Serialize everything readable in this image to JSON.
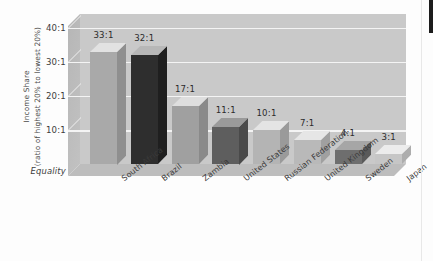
{
  "chart_data": {
    "type": "bar",
    "title": "",
    "subtitle": "",
    "xlabel": "",
    "ylabel": "Income Share (ratio of highest 20% to lowest 20%)",
    "ylabel_line1": "Income Share",
    "ylabel_line2": "(ratio of highest 20% to lowest 20%)",
    "categories": [
      "South Africa",
      "Brazil",
      "Zambia",
      "United States",
      "Russian Federation",
      "United Kingdom",
      "Sweden",
      "Japan"
    ],
    "values": [
      33,
      32,
      17,
      11,
      10,
      7,
      4,
      3
    ],
    "data_labels": [
      "33:1",
      "32:1",
      "17:1",
      "11:1",
      "10:1",
      "7:1",
      "4:1",
      "3:1"
    ],
    "ylim": [
      0,
      44
    ],
    "ytick_values": [
      10,
      20,
      30,
      40
    ],
    "ytick_labels": [
      "10:1",
      "20:1",
      "30:1",
      "40:1"
    ],
    "baseline_label": "Equality",
    "grid": true,
    "gridline_color": "#f4f4f4",
    "legend": "none",
    "legend_position": "none",
    "plot_background": "#c9c9c9",
    "figure_background": "#fdfdfd",
    "bar_colors_front": [
      "#a9a9a9",
      "#2e2e2e",
      "#a0a0a0",
      "#5e5e5e",
      "#b4b4b4",
      "#b9b9b9",
      "#6e6e6e",
      "#c6c6c6"
    ],
    "bar_colors_top": [
      "#e2e2e2",
      "#b7b7b7",
      "#dedede",
      "#9a9a9a",
      "#e4e4e4",
      "#e6e6e6",
      "#a6a6a6",
      "#ececec"
    ],
    "bar_colors_side": [
      "#8f8f8f",
      "#1f1f1f",
      "#8a8a8a",
      "#4a4a4a",
      "#9a9a9a",
      "#a0a0a0",
      "#5a5a5a",
      "#adadad"
    ]
  }
}
